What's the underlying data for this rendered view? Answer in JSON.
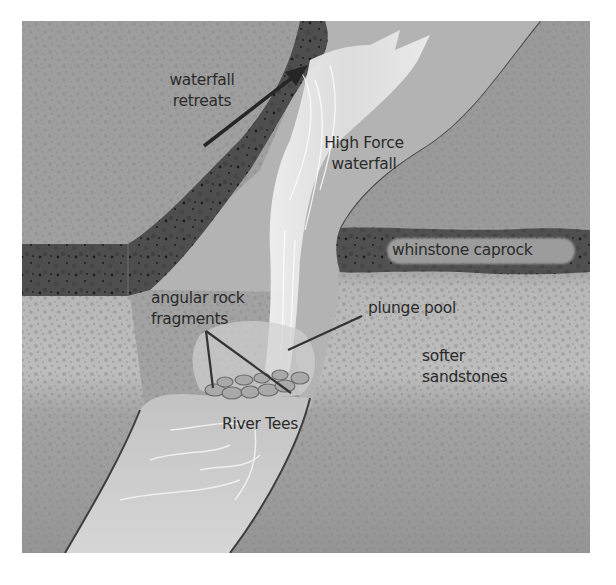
{
  "figure": {
    "colors": {
      "background": "#ffffff",
      "sandstone_upper": "#9d9d9d",
      "sandstone_light": "#b9b9b9",
      "sandstone_lower": "#979797",
      "caprock": "#4f4f4f",
      "waterfall": "#e6e6e6",
      "river": "#c9c9c9",
      "plunge_pool": "#a8a8a8",
      "text": "#2b2b2b",
      "arrow": "#262626"
    },
    "labels": {
      "waterfall_retreats_line1": "waterfall",
      "waterfall_retreats_line2": "retreats",
      "high_force_line1": "High Force",
      "high_force_line2": "waterfall",
      "whinstone_caprock": "whinstone caprock",
      "angular_rock_line1": "angular rock",
      "angular_rock_line2": "fragments",
      "plunge_pool": "plunge pool",
      "softer_line1": "softer",
      "softer_line2": "sandstones",
      "river_tees": "River Tees"
    },
    "arrow": {
      "direction": "up-right",
      "meaning": "waterfall retreats"
    }
  }
}
